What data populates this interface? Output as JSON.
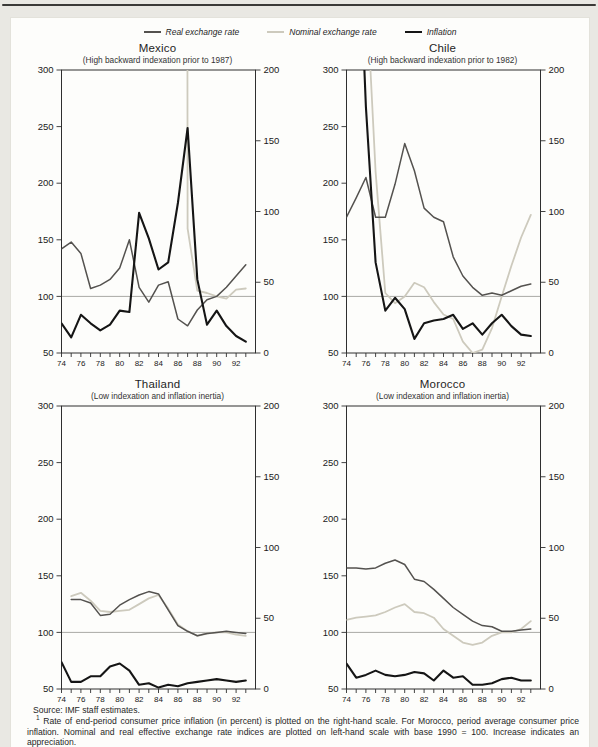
{
  "page": {
    "source_note": "Source: IMF staff estimates.",
    "footnote_marker": "1",
    "footnote_text": "Rate of end-period consumer price inflation (in percent) is plotted on the right-hand scale. For Morocco, period average consumer price inflation. Nominal and real effective exchange rate indices are plotted on left-hand scale with base 1990 = 100. Increase indicates an appreciation."
  },
  "colors": {
    "page_bg": "#e9e8e3",
    "card_bg": "#fdfdfb",
    "axis": "#2f2f2f",
    "reference_line": "#a9a9a5",
    "top_rule": "#3a3a38"
  },
  "legend": [
    {
      "key": "real",
      "label": "Real exchange rate",
      "color": "#54524f"
    },
    {
      "key": "nominal",
      "label": "Nominal exchange rate",
      "color": "#cdcabd"
    },
    {
      "key": "inflation",
      "label": "Inflation",
      "color": "#151515"
    }
  ],
  "chart_data": [
    {
      "type": "line",
      "country": "Mexico",
      "subtitle": "(High backward indexation prior to 1987)",
      "x_years": [
        1974,
        1975,
        1976,
        1977,
        1978,
        1979,
        1980,
        1981,
        1982,
        1983,
        1984,
        1985,
        1986,
        1987,
        1988,
        1989,
        1990,
        1991,
        1992,
        1993
      ],
      "x_tick_labels": [
        "74",
        "76",
        "78",
        "80",
        "82",
        "84",
        "86",
        "88",
        "90",
        "92"
      ],
      "left_axis": {
        "ticks": [
          300,
          250,
          200,
          150,
          100,
          50
        ],
        "min": 50,
        "max": 300,
        "applies_to": "exchange rate indices, 1990 = 100"
      },
      "right_axis": {
        "ticks": [
          200,
          150,
          100,
          50,
          0
        ],
        "min": 0,
        "max": 200,
        "applies_to": "inflation, percent"
      },
      "reference_line": 100,
      "annotation": {
        "text": "9,050"
      },
      "series": [
        {
          "name": "Real exchange rate",
          "axis": "left",
          "values": [
            142,
            148,
            138,
            107,
            110,
            115,
            125,
            150,
            108,
            95,
            110,
            113,
            80,
            74,
            88,
            97,
            100,
            108,
            118,
            128
          ]
        },
        {
          "name": "Nominal exchange rate",
          "axis": "left",
          "values": [
            null,
            null,
            null,
            null,
            null,
            null,
            null,
            null,
            null,
            null,
            null,
            null,
            9050,
            160,
            105,
            103,
            100,
            98,
            106,
            107
          ]
        },
        {
          "name": "Inflation",
          "axis": "right",
          "values": [
            21,
            11,
            27,
            21,
            16,
            20,
            30,
            29,
            99,
            81,
            59,
            64,
            106,
            159,
            52,
            20,
            30,
            19,
            12,
            8
          ]
        }
      ]
    },
    {
      "type": "line",
      "country": "Chile",
      "subtitle": "(High backward indexation prior to 1982)",
      "x_years": [
        1974,
        1975,
        1976,
        1977,
        1978,
        1979,
        1980,
        1981,
        1982,
        1983,
        1984,
        1985,
        1986,
        1987,
        1988,
        1989,
        1990,
        1991,
        1992,
        1993
      ],
      "x_tick_labels": [
        "74",
        "76",
        "78",
        "80",
        "82",
        "84",
        "86",
        "88",
        "90",
        "92"
      ],
      "left_axis": {
        "ticks": [
          300,
          250,
          200,
          150,
          100,
          50
        ],
        "min": 50,
        "max": 300,
        "applies_to": "exchange rate indices, 1990 = 100"
      },
      "right_axis": {
        "ticks": [
          200,
          150,
          100,
          50,
          0
        ],
        "min": 0,
        "max": 200,
        "applies_to": "inflation, percent"
      },
      "reference_line": 100,
      "annotation": null,
      "series": [
        {
          "name": "Real exchange rate",
          "axis": "left",
          "values": [
            170,
            187,
            205,
            170,
            170,
            199,
            235,
            211,
            178,
            170,
            166,
            135,
            118,
            108,
            101,
            103,
            101,
            105,
            109,
            111
          ]
        },
        {
          "name": "Nominal exchange rate",
          "axis": "left",
          "values": [
            null,
            null,
            380,
            210,
            103,
            94,
            100,
            112,
            108,
            95,
            84,
            80,
            60,
            50,
            53,
            72,
            100,
            127,
            152,
            172
          ]
        },
        {
          "name": "Inflation",
          "axis": "right",
          "values": [
            369,
            343,
            174,
            64,
            30,
            39,
            31,
            10,
            21,
            23,
            24,
            27,
            17,
            21,
            13,
            21,
            27,
            19,
            13,
            12
          ]
        }
      ]
    },
    {
      "type": "line",
      "country": "Thailand",
      "subtitle": "(Low indexation and inflation inertia)",
      "x_years": [
        1974,
        1975,
        1976,
        1977,
        1978,
        1979,
        1980,
        1981,
        1982,
        1983,
        1984,
        1985,
        1986,
        1987,
        1988,
        1989,
        1990,
        1991,
        1992,
        1993
      ],
      "x_tick_labels": [
        "74",
        "76",
        "78",
        "80",
        "82",
        "84",
        "86",
        "88",
        "90",
        "92"
      ],
      "left_axis": {
        "ticks": [
          300,
          250,
          200,
          150,
          100,
          50
        ],
        "min": 50,
        "max": 300,
        "applies_to": "exchange rate indices, 1990 = 100"
      },
      "right_axis": {
        "ticks": [
          200,
          150,
          100,
          50,
          0
        ],
        "min": 0,
        "max": 200,
        "applies_to": "inflation, percent"
      },
      "reference_line": 100,
      "annotation": null,
      "series": [
        {
          "name": "Real exchange rate",
          "axis": "left",
          "values": [
            null,
            129,
            129,
            126,
            115,
            116,
            124,
            129,
            133,
            136,
            134,
            120,
            106,
            101,
            97,
            99,
            100,
            101,
            100,
            99
          ]
        },
        {
          "name": "Nominal exchange rate",
          "axis": "left",
          "values": [
            null,
            132,
            135,
            128,
            119,
            118,
            119,
            120,
            125,
            130,
            133,
            121,
            107,
            101,
            97,
            99,
            100,
            100,
            98,
            97
          ]
        },
        {
          "name": "Inflation",
          "axis": "right",
          "values": [
            19,
            5,
            5,
            9,
            9,
            16,
            18,
            13,
            3,
            4,
            1,
            3,
            2,
            4,
            5,
            6,
            7,
            6,
            5,
            6
          ]
        }
      ]
    },
    {
      "type": "line",
      "country": "Morocco",
      "subtitle": "(Low indexation and inflation inertia)",
      "x_years": [
        1974,
        1975,
        1976,
        1977,
        1978,
        1979,
        1980,
        1981,
        1982,
        1983,
        1984,
        1985,
        1986,
        1987,
        1988,
        1989,
        1990,
        1991,
        1992,
        1993
      ],
      "x_tick_labels": [
        "74",
        "76",
        "78",
        "80",
        "82",
        "84",
        "86",
        "88",
        "90",
        "92"
      ],
      "left_axis": {
        "ticks": [
          300,
          250,
          200,
          150,
          100,
          50
        ],
        "min": 50,
        "max": 300,
        "applies_to": "exchange rate indices, 1990 = 100"
      },
      "right_axis": {
        "ticks": [
          200,
          150,
          100,
          50,
          0
        ],
        "min": 0,
        "max": 200,
        "applies_to": "inflation, percent"
      },
      "reference_line": 100,
      "annotation": null,
      "series": [
        {
          "name": "Real exchange rate",
          "axis": "left",
          "values": [
            157,
            157,
            156,
            157,
            161,
            164,
            160,
            147,
            145,
            138,
            130,
            122,
            116,
            110,
            106,
            105,
            101,
            101,
            102,
            103
          ]
        },
        {
          "name": "Nominal exchange rate",
          "axis": "left",
          "values": [
            111,
            113,
            114,
            115,
            118,
            122,
            125,
            118,
            117,
            113,
            103,
            97,
            91,
            89,
            91,
            97,
            100,
            100,
            103,
            110
          ]
        },
        {
          "name": "Inflation",
          "axis": "right",
          "values": [
            18,
            8,
            10,
            13,
            10,
            9,
            10,
            12,
            11,
            6,
            13,
            8,
            9,
            3,
            3,
            4,
            7,
            8,
            6,
            6
          ]
        }
      ]
    }
  ]
}
